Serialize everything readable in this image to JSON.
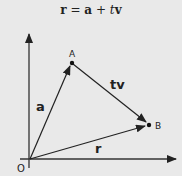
{
  "equation": {
    "lhs": "r",
    "eq": " = ",
    "term1": "a",
    "plus": " + ",
    "scalar": "t",
    "term2": "v"
  },
  "diagram": {
    "points": {
      "origin": "O",
      "A": "A",
      "B": "B"
    },
    "vectors": {
      "a": "a",
      "tv": "tv",
      "r": "r"
    },
    "colors": {
      "background": "#e9e9e9",
      "ink": "#222222"
    }
  }
}
